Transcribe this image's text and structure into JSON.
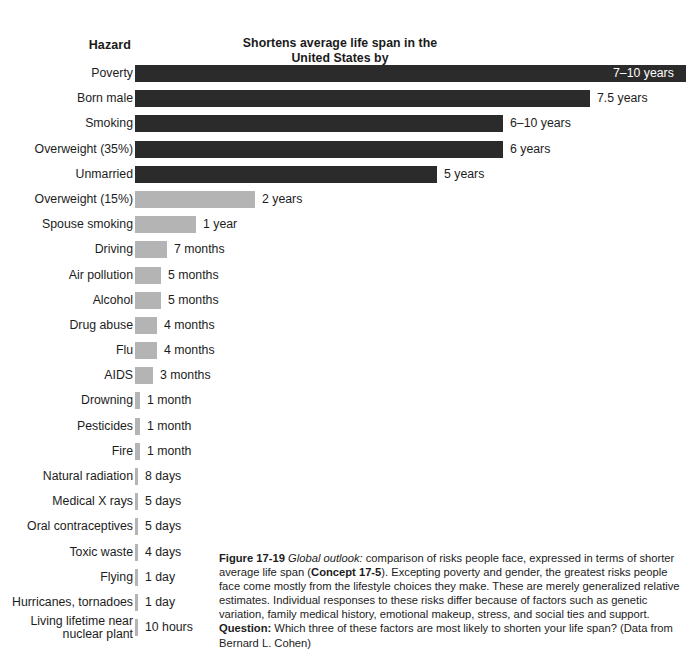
{
  "header": {
    "hazard_label": "Hazard",
    "value_label": "Shortens average life span\nin the United States by"
  },
  "chart_data": {
    "type": "bar",
    "title": "Shortens average life span in the United States by",
    "xlabel": "",
    "ylabel": "Hazard",
    "orientation": "horizontal",
    "grid": false,
    "legend": "none",
    "categories": [
      "Poverty",
      "Born male",
      "Smoking",
      "Overweight (35%)",
      "Unmarried",
      "Overweight (15%)",
      "Spouse smoking",
      "Driving",
      "Air pollution",
      "Alcohol",
      "Drug abuse",
      "Flu",
      "AIDS",
      "Drowning",
      "Pesticides",
      "Fire",
      "Natural radiation",
      "Medical X rays",
      "Oral contraceptives",
      "Toxic waste",
      "Flying",
      "Hurricanes, tornadoes",
      "Living lifetime near nuclear plant"
    ],
    "value_labels": [
      "7–10 years",
      "7.5 years",
      "6–10 years",
      "6 years",
      "5 years",
      "2 years",
      "1 year",
      "7 months",
      "5 months",
      "5 months",
      "4 months",
      "4 months",
      "3 months",
      "1 month",
      "1 month",
      "1 month",
      "8 days",
      "5 days",
      "5 days",
      "4 days",
      "1 day",
      "1 day",
      "10 hours"
    ],
    "values_years": [
      8.5,
      7.5,
      8.0,
      6.0,
      5.0,
      2.0,
      1.0,
      0.583,
      0.417,
      0.417,
      0.333,
      0.333,
      0.25,
      0.083,
      0.083,
      0.083,
      0.0219,
      0.0137,
      0.0137,
      0.011,
      0.0027,
      0.0027,
      0.00114
    ],
    "rows": [
      {
        "label": "Poverty",
        "value": "7–10 years",
        "bar_px": 551,
        "shade": "dark",
        "label_inside": true,
        "two_line": false
      },
      {
        "label": "Born male",
        "value": "7.5 years",
        "bar_px": 455,
        "shade": "dark",
        "label_inside": false,
        "two_line": false
      },
      {
        "label": "Smoking",
        "value": "6–10 years",
        "bar_px": 368,
        "shade": "dark",
        "label_inside": false,
        "two_line": false
      },
      {
        "label": "Overweight (35%)",
        "value": "6 years",
        "bar_px": 368,
        "shade": "dark",
        "label_inside": false,
        "two_line": false
      },
      {
        "label": "Unmarried",
        "value": "5 years",
        "bar_px": 302,
        "shade": "dark",
        "label_inside": false,
        "two_line": false
      },
      {
        "label": "Overweight (15%)",
        "value": "2 years",
        "bar_px": 120,
        "shade": "light",
        "label_inside": false,
        "two_line": false
      },
      {
        "label": "Spouse smoking",
        "value": "1 year",
        "bar_px": 61,
        "shade": "light",
        "label_inside": false,
        "two_line": false
      },
      {
        "label": "Driving",
        "value": "7 months",
        "bar_px": 32,
        "shade": "light",
        "label_inside": false,
        "two_line": false
      },
      {
        "label": "Air pollution",
        "value": "5 months",
        "bar_px": 26,
        "shade": "light",
        "label_inside": false,
        "two_line": false
      },
      {
        "label": "Alcohol",
        "value": "5 months",
        "bar_px": 26,
        "shade": "light",
        "label_inside": false,
        "two_line": false
      },
      {
        "label": "Drug abuse",
        "value": "4 months",
        "bar_px": 22,
        "shade": "light",
        "label_inside": false,
        "two_line": false
      },
      {
        "label": "Flu",
        "value": "4 months",
        "bar_px": 22,
        "shade": "light",
        "label_inside": false,
        "two_line": false
      },
      {
        "label": "AIDS",
        "value": "3 months",
        "bar_px": 18,
        "shade": "light",
        "label_inside": false,
        "two_line": false
      },
      {
        "label": "Drowning",
        "value": "1 month",
        "bar_px": 5,
        "shade": "sliver",
        "label_inside": false,
        "two_line": false
      },
      {
        "label": "Pesticides",
        "value": "1 month",
        "bar_px": 5,
        "shade": "sliver",
        "label_inside": false,
        "two_line": false
      },
      {
        "label": "Fire",
        "value": "1 month",
        "bar_px": 5,
        "shade": "sliver",
        "label_inside": false,
        "two_line": false
      },
      {
        "label": "Natural radiation",
        "value": "8 days",
        "bar_px": 3,
        "shade": "sliver",
        "label_inside": false,
        "two_line": false
      },
      {
        "label": "Medical X rays",
        "value": "5 days",
        "bar_px": 3,
        "shade": "sliver",
        "label_inside": false,
        "two_line": false
      },
      {
        "label": "Oral contraceptives",
        "value": "5 days",
        "bar_px": 3,
        "shade": "sliver",
        "label_inside": false,
        "two_line": false
      },
      {
        "label": "Toxic waste",
        "value": "4 days",
        "bar_px": 3,
        "shade": "sliver",
        "label_inside": false,
        "two_line": false
      },
      {
        "label": "Flying",
        "value": "1 day",
        "bar_px": 3,
        "shade": "sliver",
        "label_inside": false,
        "two_line": false
      },
      {
        "label": "Hurricanes, tornadoes",
        "value": "1 day",
        "bar_px": 3,
        "shade": "sliver",
        "label_inside": false,
        "two_line": false
      },
      {
        "label": "Living lifetime near\nnuclear plant",
        "value": "10 hours",
        "bar_px": 3,
        "shade": "sliver",
        "label_inside": false,
        "two_line": true
      }
    ],
    "colors": {
      "dark_bar": "#2b2b2b",
      "light_bar": "#b4b4b4",
      "text": "#1c1c1c",
      "inside_label": "#ffffff",
      "background": "#ffffff"
    }
  },
  "caption": {
    "figure_number": "Figure 17-19",
    "italic_lead": "Global outlook:",
    "text_1": " comparison of risks people face, expressed in terms of shorter average life span (",
    "bold_concept": "Concept 17-5",
    "text_2": "). Excepting poverty and gender, the greatest risks people face come mostly from the lifestyle choices they make. These are merely generalized relative estimates. Individual responses to these risks differ because of factors such as genetic variation, family medical history, emotional makeup, stress, and social ties and support. ",
    "bold_question": "Question:",
    "text_3": " Which three of these factors are most likely to shorten your life span? (Data from Bernard L. Cohen)"
  }
}
